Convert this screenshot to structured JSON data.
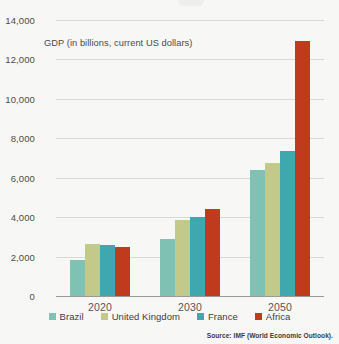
{
  "chart_data": {
    "type": "bar",
    "title": "",
    "subtitle": "",
    "xlabel": "",
    "ylabel": "GDP (in billions, current US dollars)",
    "categories": [
      "2020",
      "2030",
      "2050"
    ],
    "ylim": [
      0,
      14000
    ],
    "yticks": [
      "0",
      "2,000",
      "4,000",
      "6,000",
      "8,000",
      "10,000",
      "12,000",
      "14,000"
    ],
    "ytick_values": [
      0,
      2000,
      4000,
      6000,
      8000,
      10000,
      12000,
      14000
    ],
    "grid": true,
    "legend_position": "bottom",
    "series": [
      {
        "name": "Brazil",
        "color": "#7fc2b4",
        "values": [
          1840,
          2900,
          6400
        ]
      },
      {
        "name": "United Kingdom",
        "color": "#c3c988",
        "values": [
          2640,
          3880,
          6760
        ]
      },
      {
        "name": "France",
        "color": "#3fa8ae",
        "values": [
          2600,
          4010,
          7350
        ]
      },
      {
        "name": "Africa",
        "color": "#c03a1d",
        "values": [
          2480,
          4420,
          12950
        ]
      }
    ],
    "source": "Source: IMF (World Economic Outlook)."
  },
  "colors": {
    "background": "#f7f7f5",
    "gridline": "#d8d8d4",
    "axis": "#9a9a96",
    "tick_text": "#4c4c4c",
    "label_text": "#555555"
  }
}
